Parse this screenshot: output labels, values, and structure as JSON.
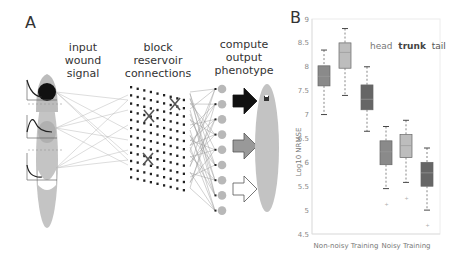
{
  "panel_a": {
    "label": "A",
    "stages": [
      {
        "lines": [
          "input",
          "wound",
          "signal"
        ]
      },
      {
        "lines": [
          "block",
          "reservoir",
          "connections"
        ]
      },
      {
        "lines": [
          "compute",
          "output",
          "phenotype"
        ]
      }
    ],
    "grid": {
      "rows": 12,
      "cols": 9
    },
    "output_nodes": 9,
    "arrows": [
      {
        "fill": "#111111"
      },
      {
        "fill": "#999999"
      },
      {
        "fill": "#ffffff"
      }
    ]
  },
  "panel_b": {
    "label": "B",
    "legend": [
      {
        "text": "head",
        "weight": "normal",
        "color": "#777777"
      },
      {
        "text": "trunk",
        "weight": "bold",
        "color": "#444444"
      },
      {
        "text": "tail",
        "weight": "normal",
        "color": "#555555"
      }
    ]
  },
  "chart_data": {
    "type": "box",
    "title": "",
    "xlabel": "",
    "ylabel": "Log10 NRMSE",
    "ylim": [
      4.5,
      9
    ],
    "yticks": [
      9,
      8.5,
      8,
      7.5,
      7,
      6.5,
      6,
      5.5,
      5,
      4.5
    ],
    "grid": false,
    "legend_position": "upper right",
    "categories": [
      "Non-noisy Training",
      "Noisy Training"
    ],
    "series": [
      {
        "name": "head",
        "color": "#8a8a8a",
        "boxes": [
          {
            "group": "Non-noisy Training",
            "whisker_low": 7.0,
            "q1": 7.6,
            "median": 7.8,
            "q3": 8.02,
            "whisker_high": 8.35,
            "outliers": []
          },
          {
            "group": "Noisy Training",
            "whisker_low": 5.45,
            "q1": 5.95,
            "median": 6.22,
            "q3": 6.45,
            "whisker_high": 6.75,
            "outliers": [
              5.12
            ]
          }
        ]
      },
      {
        "name": "trunk",
        "color": "#bdbdbd",
        "boxes": [
          {
            "group": "Non-noisy Training",
            "whisker_low": 7.4,
            "q1": 7.97,
            "median": 8.3,
            "q3": 8.5,
            "whisker_high": 8.8,
            "outliers": []
          },
          {
            "group": "Noisy Training",
            "whisker_low": 5.58,
            "q1": 6.1,
            "median": 6.35,
            "q3": 6.58,
            "whisker_high": 6.88,
            "outliers": [
              5.25
            ]
          }
        ]
      },
      {
        "name": "tail",
        "color": "#666666",
        "boxes": [
          {
            "group": "Non-noisy Training",
            "whisker_low": 6.65,
            "q1": 7.1,
            "median": 7.32,
            "q3": 7.62,
            "whisker_high": 8.0,
            "outliers": []
          },
          {
            "group": "Noisy Training",
            "whisker_low": 5.0,
            "q1": 5.5,
            "median": 5.78,
            "q3": 6.0,
            "whisker_high": 6.3,
            "outliers": [
              4.68
            ]
          }
        ]
      }
    ]
  }
}
